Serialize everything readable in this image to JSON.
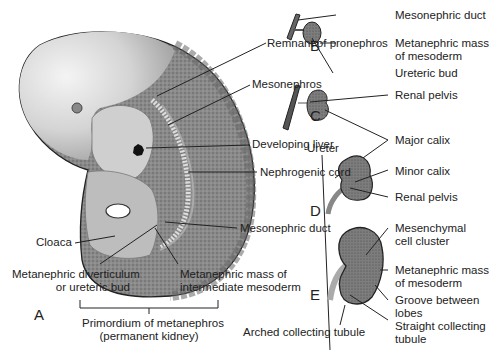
{
  "figure": {
    "panels": {
      "A": "A",
      "B": "B",
      "C": "C",
      "D": "D",
      "E": "E"
    },
    "panel_A": {
      "remnant_pronephros": "Remnant of pronephros",
      "mesonephros": "Mesonephros",
      "developing_liver": "Developing liver",
      "nephrogenic_cord": "Nephrogenic cord",
      "mesonephric_duct": "Mesonephric duct",
      "cloaca": "Cloaca",
      "diverticulum_line1": "Metanephric diverticulum",
      "diverticulum_line2": "or ureteric bud",
      "mass_line1": "Metanephric mass of",
      "mass_line2": "intermediate mesoderm",
      "primordium_line1": "Primordium of metanephros",
      "primordium_line2": "(permanent kidney)"
    },
    "panel_B": {
      "mesonephric_duct": "Mesonephric duct",
      "mass_line1": "Metanephric mass",
      "mass_line2": "of mesoderm",
      "ureteric_bud": "Ureteric bud"
    },
    "panel_CD": {
      "renal_pelvis_c": "Renal pelvis",
      "ureter": "Ureter",
      "major_calix": "Major calix",
      "minor_calix": "Minor calix",
      "renal_pelvis_d": "Renal pelvis"
    },
    "panel_E": {
      "mesenchymal_line1": "Mesenchymal",
      "mesenchymal_line2": "cell cluster",
      "mass_line1": "Metanephric mass",
      "mass_line2": "of mesoderm",
      "groove_line1": "Groove between",
      "groove_line2": "lobes",
      "straight_line1": "Straight collecting",
      "straight_line2": "tubule",
      "arched": "Arched collecting tubule"
    }
  }
}
